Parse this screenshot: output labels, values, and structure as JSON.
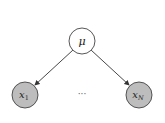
{
  "diagram": {
    "type": "graphical-model",
    "nodes": [
      {
        "id": "mu",
        "label": "μ",
        "observed": false,
        "cx": 82,
        "cy": 41,
        "r": 13,
        "fill": "#ffffff",
        "stroke": "#444444"
      },
      {
        "id": "x1",
        "label": "x",
        "subscript": "1",
        "observed": true,
        "cx": 25,
        "cy": 95,
        "r": 13,
        "fill": "#bdbdbd",
        "stroke": "#444444"
      },
      {
        "id": "xN",
        "label": "x",
        "subscript": "N",
        "observed": true,
        "cx": 139,
        "cy": 95,
        "r": 13,
        "fill": "#bdbdbd",
        "stroke": "#444444"
      }
    ],
    "edges": [
      {
        "from": "mu",
        "to": "x1"
      },
      {
        "from": "mu",
        "to": "xN"
      }
    ],
    "ellipsis": "···"
  }
}
